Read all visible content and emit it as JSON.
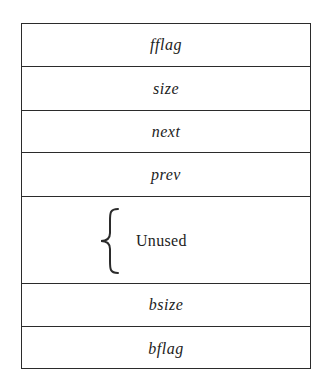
{
  "diagram": {
    "type": "memory-block-layout",
    "colors": {
      "line": "#2b2b2b",
      "text": "#222222",
      "background": "#ffffff"
    },
    "fields": [
      {
        "label": "fflag",
        "style": "italic"
      },
      {
        "label": "size",
        "style": "italic"
      },
      {
        "label": "next",
        "style": "italic"
      },
      {
        "label": "prev",
        "style": "italic"
      },
      {
        "label": "Unused",
        "style": "roman",
        "brace": true
      },
      {
        "label": "bsize",
        "style": "italic"
      },
      {
        "label": "bflag",
        "style": "italic"
      }
    ]
  }
}
